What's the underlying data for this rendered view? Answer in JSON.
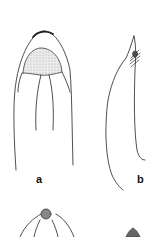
{
  "figure": {
    "panels": [
      {
        "id": "a",
        "label": "a",
        "description": "dorsal view of elongated structure with stippled apical region and longitudinal lines"
      },
      {
        "id": "b",
        "label": "b",
        "description": "lateral view with pointed tip and hatched region near apex"
      },
      {
        "id": "c",
        "label": "",
        "description": "partially visible drawing with stippled rounded tip (cropped)"
      },
      {
        "id": "d",
        "label": "",
        "description": "partially visible drawing with stippled tip (cropped)"
      }
    ],
    "colors": {
      "line": "#222222",
      "stipple": "#d9d9d9",
      "hatch_fill": "#8a8a8a",
      "background": "#ffffff"
    }
  }
}
